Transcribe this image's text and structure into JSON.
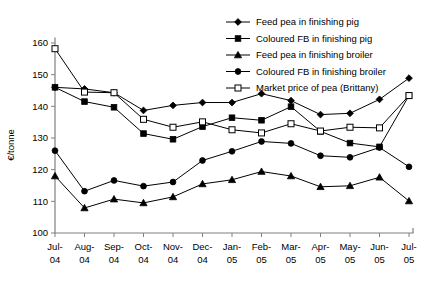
{
  "chart_data": {
    "type": "line",
    "title": "",
    "xlabel": "",
    "ylabel": "€/tonne",
    "ylim": [
      100,
      160
    ],
    "yticks": [
      100,
      110,
      120,
      130,
      140,
      150,
      160
    ],
    "grid": false,
    "legend_position": "top-right",
    "categories": [
      "Jul-04",
      "Aug-04",
      "Sep-04",
      "Oct-04",
      "Nov-04",
      "Dec-04",
      "Jan-05",
      "Feb-05",
      "Mar-05",
      "Apr-05",
      "May-05",
      "Jun-05",
      "Jul-05"
    ],
    "category_lines": [
      [
        "Jul-",
        "04"
      ],
      [
        "Aug-",
        "04"
      ],
      [
        "Sep-",
        "04"
      ],
      [
        "Oct-",
        "04"
      ],
      [
        "Nov-",
        "04"
      ],
      [
        "Dec-",
        "04"
      ],
      [
        "Jan-",
        "05"
      ],
      [
        "Feb-",
        "05"
      ],
      [
        "Mar-",
        "05"
      ],
      [
        "Apr-",
        "05"
      ],
      [
        "May-",
        "05"
      ],
      [
        "Jun-",
        "05"
      ],
      [
        "Jul-",
        "05"
      ]
    ],
    "series": [
      {
        "name": "Feed pea in finishing pig",
        "marker": "diamond",
        "values": [
          146.0,
          145.5,
          144.3,
          138.7,
          140.3,
          141.2,
          141.2,
          144.0,
          141.8,
          137.4,
          137.8,
          142.2,
          148.9
        ]
      },
      {
        "name": "Coloured FB in finishing pig",
        "marker": "square",
        "values": [
          146.0,
          141.5,
          139.7,
          131.4,
          129.6,
          133.6,
          136.4,
          135.6,
          139.9,
          132.1,
          128.4,
          127.2,
          143.4
        ]
      },
      {
        "name": "Feed pea in finishing broiler",
        "marker": "triangle",
        "values": [
          118.0,
          107.9,
          110.7,
          109.5,
          111.4,
          115.5,
          116.8,
          119.4,
          118.0,
          114.6,
          114.9,
          117.6,
          110.1
        ]
      },
      {
        "name": "Coloured FB in finishing broiler",
        "marker": "circle",
        "values": [
          126.0,
          113.2,
          116.6,
          114.8,
          116.1,
          122.9,
          125.8,
          128.9,
          128.3,
          124.4,
          123.9,
          127.0,
          120.9
        ]
      },
      {
        "name": "Market price of pea (Brittany)",
        "marker": "open-square",
        "values": [
          158.2,
          144.5,
          144.3,
          135.9,
          133.4,
          135.1,
          132.6,
          131.6,
          134.5,
          132.2,
          133.4,
          133.2,
          143.4
        ]
      }
    ]
  },
  "legend": {
    "items": [
      {
        "label": "Feed pea in finishing pig",
        "marker": "diamond"
      },
      {
        "label": "Coloured FB in finishing pig",
        "marker": "square"
      },
      {
        "label": "Feed pea in finishing broiler",
        "marker": "triangle"
      },
      {
        "label": "Coloured FB in finishing broiler",
        "marker": "circle"
      },
      {
        "label": "Market price of pea (Brittany)",
        "marker": "open-square"
      }
    ]
  },
  "colors": {
    "series": "#000000",
    "axis": "#808080",
    "background": "#ffffff"
  }
}
